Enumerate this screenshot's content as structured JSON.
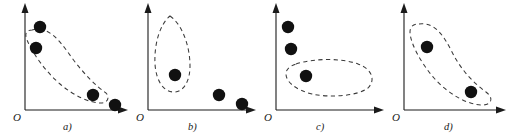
{
  "figure": {
    "panel_count": 4,
    "width": 514,
    "height": 140,
    "background_color": "#ffffff",
    "point_color": "#111111",
    "axis_color": "#1a1a1a",
    "curve_color": "#3a3a3a",
    "curve_style": "dashed"
  },
  "panels": [
    {
      "id": "a",
      "caption": "a)",
      "origin_label": "O",
      "points": [
        {
          "cx": 40,
          "cy": 27,
          "r": 6.2,
          "inside_cluster": true
        },
        {
          "cx": 36,
          "cy": 48,
          "r": 6.2,
          "inside_cluster": true
        },
        {
          "cx": 93,
          "cy": 95,
          "r": 6.2,
          "inside_cluster": true
        },
        {
          "cx": 115,
          "cy": 105,
          "r": 6.2,
          "inside_cluster": false
        }
      ],
      "cluster_shape": "crescent-band",
      "cluster_path": "M 32 30 C 48 26 58 38 72 58 C 84 74 96 86 106 93 C 110 97 108 103 101 103 C 90 103 74 96 60 84 C 44 70 32 52 27 40 C 24 33 27 30 32 30 Z"
    },
    {
      "id": "b",
      "caption": "b)",
      "origin_label": "O",
      "points": [
        {
          "cx": 45,
          "cy": 75,
          "r": 6.2,
          "inside_cluster": true
        },
        {
          "cx": 89,
          "cy": 95,
          "r": 6.2,
          "inside_cluster": false
        },
        {
          "cx": 112,
          "cy": 104,
          "r": 6.2,
          "inside_cluster": false
        }
      ],
      "cluster_shape": "teardrop-vertical",
      "cluster_path": "M 40 16 C 52 24 60 46 60 66 C 60 82 53 92 44 92 C 33 92 26 80 25 64 C 24 44 30 24 40 16 Z"
    },
    {
      "id": "c",
      "caption": "c)",
      "origin_label": "O",
      "points": [
        {
          "cx": 30,
          "cy": 27,
          "r": 6.2,
          "inside_cluster": false
        },
        {
          "cx": 33,
          "cy": 49,
          "r": 6.2,
          "inside_cluster": false
        },
        {
          "cx": 48,
          "cy": 76,
          "r": 6.2,
          "inside_cluster": true
        }
      ],
      "cluster_shape": "horizontal-blob",
      "cluster_path": "M 38 64 C 56 58 84 58 100 64 C 114 69 118 80 110 88 C 100 96 72 98 54 94 C 38 90 28 82 28 74 C 28 69 32 66 38 64 Z"
    },
    {
      "id": "d",
      "caption": "d)",
      "origin_label": "O",
      "points": [
        {
          "cx": 41,
          "cy": 47,
          "r": 6.2,
          "inside_cluster": true
        },
        {
          "cx": 85,
          "cy": 92,
          "r": 6.2,
          "inside_cluster": true
        }
      ],
      "cluster_shape": "crescent-band",
      "cluster_path": "M 33 24 C 48 22 57 34 66 52 C 74 68 86 82 100 92 C 108 98 106 105 96 105 C 82 105 62 94 48 78 C 34 62 24 42 24 32 C 24 26 28 24 33 24 Z"
    }
  ]
}
